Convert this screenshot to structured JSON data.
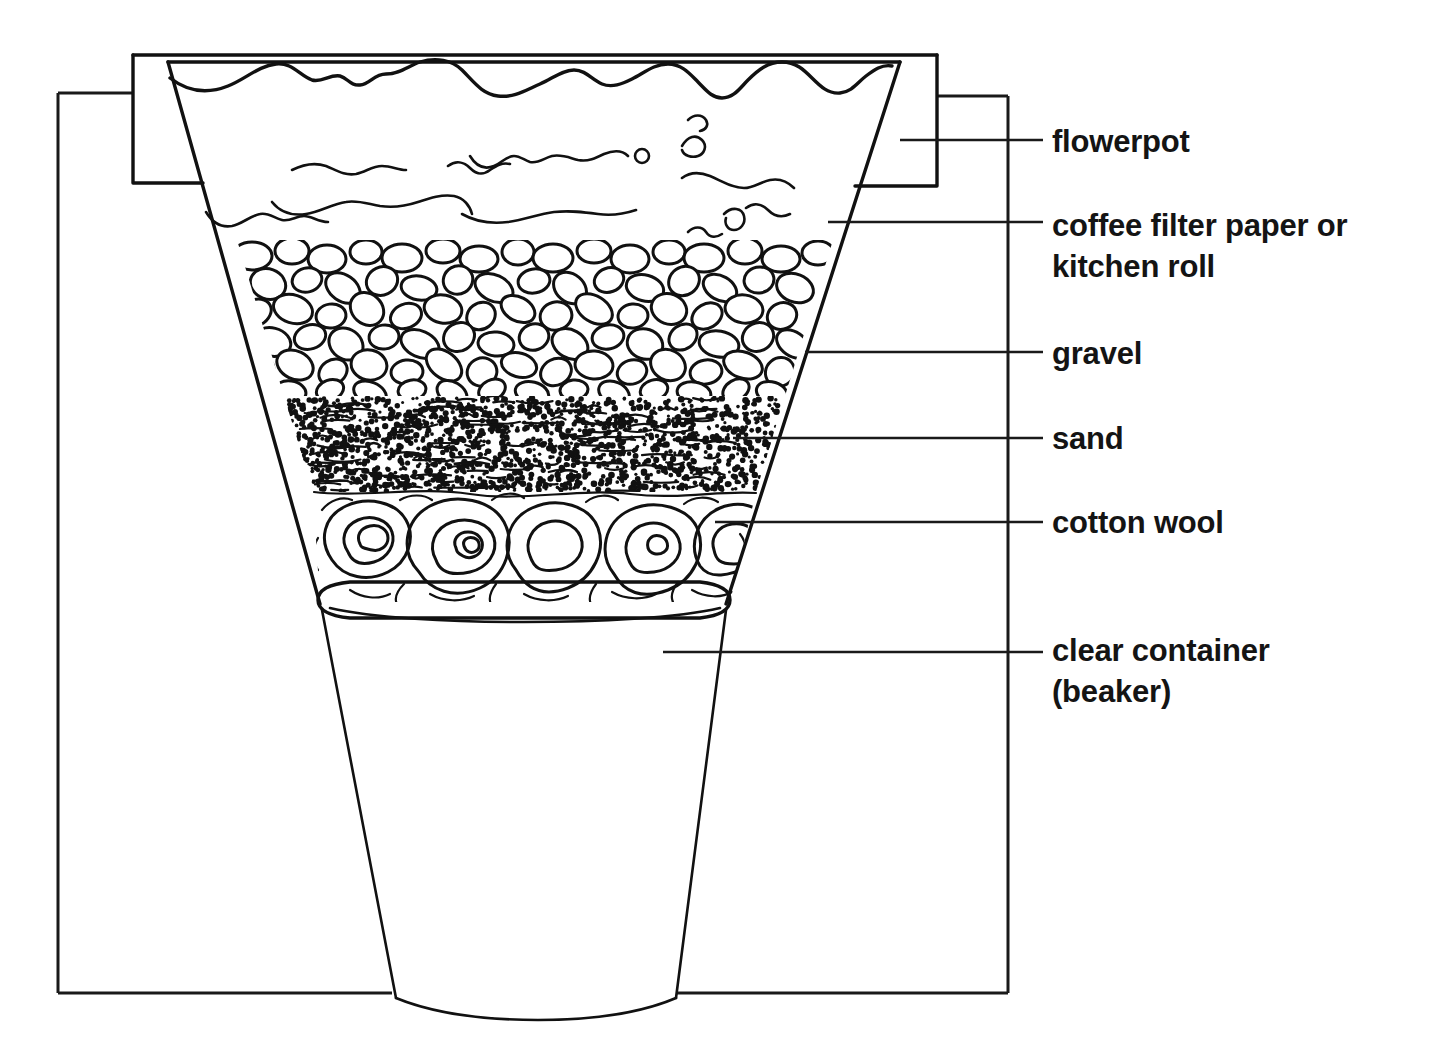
{
  "diagram": {
    "background_color": "#ffffff",
    "ink_color": "#141414",
    "labels": [
      {
        "id": "flowerpot",
        "text": "flowerpot",
        "lines": [
          "flowerpot"
        ],
        "text_x": 1052,
        "text_y": 152,
        "leader": {
          "x1": 900,
          "y1": 140,
          "x2": 1043,
          "y2": 140
        }
      },
      {
        "id": "coffee-filter-paper-or-kitchen-roll",
        "text": "coffee filter paper or kitchen roll",
        "lines": [
          "coffee filter paper or",
          "kitchen roll"
        ],
        "text_x": 1052,
        "text_y": 236,
        "leader": {
          "x1": 828,
          "y1": 222,
          "x2": 1043,
          "y2": 222
        }
      },
      {
        "id": "gravel",
        "text": "gravel",
        "lines": [
          "gravel"
        ],
        "text_x": 1052,
        "text_y": 364,
        "leader": {
          "x1": 805,
          "y1": 352,
          "x2": 1043,
          "y2": 352
        }
      },
      {
        "id": "sand",
        "text": "sand",
        "lines": [
          "sand"
        ],
        "text_x": 1052,
        "text_y": 449,
        "leader": {
          "x1": 733,
          "y1": 438,
          "x2": 1043,
          "y2": 438
        }
      },
      {
        "id": "cotton-wool",
        "text": "cotton wool",
        "lines": [
          "cotton wool"
        ],
        "text_x": 1052,
        "text_y": 533,
        "leader": {
          "x1": 715,
          "y1": 522,
          "x2": 1043,
          "y2": 522
        }
      },
      {
        "id": "clear-container-beaker",
        "text": "clear container (beaker)",
        "lines": [
          "clear container",
          "(beaker)"
        ],
        "text_x": 1052,
        "text_y": 661,
        "leader": {
          "x1": 663,
          "y1": 652,
          "x2": 1043,
          "y2": 652
        }
      }
    ],
    "layers": [
      {
        "id": "dirty-water",
        "name": "dirty water",
        "top_y": 62,
        "bottom_y": 240
      },
      {
        "id": "gravel",
        "name": "gravel",
        "top_y": 240,
        "bottom_y": 396
      },
      {
        "id": "sand",
        "name": "sand",
        "top_y": 396,
        "bottom_y": 492
      },
      {
        "id": "cotton-wool",
        "name": "cotton wool",
        "top_y": 492,
        "bottom_y": 600
      }
    ],
    "parts": {
      "frame": {
        "left": 58,
        "top": 93,
        "right": 1008,
        "bottom": 993
      },
      "flowerpot_rim": {
        "left": 133,
        "right": 937,
        "top": 55,
        "bottom_left_y": 183,
        "bottom_right_y": 186
      },
      "pot_body": {
        "top_left_x": 168,
        "top_right_x": 900,
        "bottom_left_x": 320,
        "bottom_right_x": 726,
        "bottom_y": 600
      },
      "beaker": {
        "rim_y": 604,
        "rim_left_x": 318,
        "rim_right_x": 728,
        "base_y": 1012,
        "base_left_x": 396,
        "base_right_x": 672
      }
    }
  }
}
